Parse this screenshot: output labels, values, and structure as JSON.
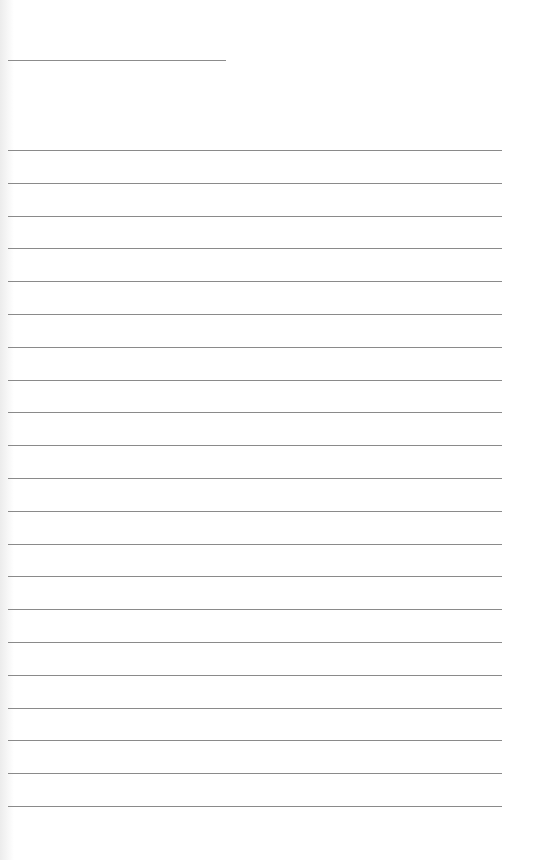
{
  "page": {
    "type": "blank lined notepaper",
    "background_color": "#ffffff",
    "line_color": "#8a8a8a",
    "header_line": {
      "x": 8,
      "y": 60,
      "width": 218
    },
    "ruled_lines": {
      "count": 21,
      "first_y": 150,
      "spacing": 32.8,
      "x": 8,
      "width": 494
    }
  }
}
